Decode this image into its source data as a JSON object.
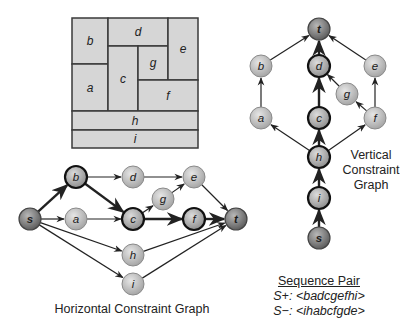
{
  "floorplan": {
    "blocks": [
      {
        "id": "b",
        "label": "b",
        "x": 72,
        "y": 18,
        "w": 36,
        "h": 46
      },
      {
        "id": "a",
        "label": "a",
        "x": 72,
        "y": 64,
        "w": 36,
        "h": 47
      },
      {
        "id": "d",
        "label": "d",
        "x": 108,
        "y": 18,
        "w": 60,
        "h": 28
      },
      {
        "id": "c",
        "label": "c",
        "x": 108,
        "y": 46,
        "w": 30,
        "h": 65
      },
      {
        "id": "g",
        "label": "g",
        "x": 138,
        "y": 46,
        "w": 30,
        "h": 34
      },
      {
        "id": "e",
        "label": "e",
        "x": 168,
        "y": 18,
        "w": 30,
        "h": 62
      },
      {
        "id": "f",
        "label": "f",
        "x": 138,
        "y": 80,
        "w": 60,
        "h": 31
      },
      {
        "id": "h",
        "label": "h",
        "x": 72,
        "y": 111,
        "w": 126,
        "h": 19
      },
      {
        "id": "i",
        "label": "i",
        "x": 72,
        "y": 130,
        "w": 126,
        "h": 18
      }
    ],
    "fill": "#d6d6d6",
    "stroke": "#3a3a3a"
  },
  "horizontal_graph": {
    "title": "Horizontal Constraint Graph",
    "nodes": [
      {
        "id": "s",
        "label": "s",
        "x": 30,
        "y": 219,
        "kind": "terminal"
      },
      {
        "id": "b",
        "label": "b",
        "x": 76,
        "y": 177,
        "kind": "critical"
      },
      {
        "id": "a",
        "label": "a",
        "x": 76,
        "y": 219,
        "kind": "normal"
      },
      {
        "id": "d",
        "label": "d",
        "x": 133,
        "y": 177,
        "kind": "normal"
      },
      {
        "id": "c",
        "label": "c",
        "x": 133,
        "y": 219,
        "kind": "critical"
      },
      {
        "id": "g",
        "label": "g",
        "x": 163,
        "y": 199,
        "kind": "normal"
      },
      {
        "id": "e",
        "label": "e",
        "x": 194,
        "y": 177,
        "kind": "normal"
      },
      {
        "id": "f",
        "label": "f",
        "x": 194,
        "y": 219,
        "kind": "critical"
      },
      {
        "id": "h",
        "label": "h",
        "x": 133,
        "y": 255,
        "kind": "normal"
      },
      {
        "id": "i",
        "label": "i",
        "x": 133,
        "y": 284,
        "kind": "normal"
      },
      {
        "id": "t",
        "label": "t",
        "x": 236,
        "y": 219,
        "kind": "terminal"
      }
    ],
    "edges": [
      {
        "from": "s",
        "to": "b",
        "critical": true
      },
      {
        "from": "s",
        "to": "a",
        "critical": false
      },
      {
        "from": "s",
        "to": "h",
        "critical": false
      },
      {
        "from": "s",
        "to": "i",
        "critical": false
      },
      {
        "from": "b",
        "to": "d",
        "critical": false
      },
      {
        "from": "b",
        "to": "c",
        "critical": true
      },
      {
        "from": "a",
        "to": "c",
        "critical": false
      },
      {
        "from": "d",
        "to": "e",
        "critical": false
      },
      {
        "from": "c",
        "to": "g",
        "critical": false
      },
      {
        "from": "g",
        "to": "e",
        "critical": false
      },
      {
        "from": "c",
        "to": "f",
        "critical": true
      },
      {
        "from": "e",
        "to": "t",
        "critical": false
      },
      {
        "from": "f",
        "to": "t",
        "critical": true
      },
      {
        "from": "h",
        "to": "t",
        "critical": false
      },
      {
        "from": "i",
        "to": "t",
        "critical": false
      }
    ]
  },
  "vertical_graph": {
    "title_lines": [
      "Vertical",
      "Constraint",
      "Graph"
    ],
    "nodes": [
      {
        "id": "t",
        "label": "t",
        "x": 319,
        "y": 29,
        "kind": "terminal"
      },
      {
        "id": "b",
        "label": "b",
        "x": 261,
        "y": 66,
        "kind": "normal"
      },
      {
        "id": "d",
        "label": "d",
        "x": 319,
        "y": 66,
        "kind": "critical"
      },
      {
        "id": "e",
        "label": "e",
        "x": 375,
        "y": 66,
        "kind": "normal"
      },
      {
        "id": "g",
        "label": "g",
        "x": 347,
        "y": 94,
        "kind": "normal"
      },
      {
        "id": "a",
        "label": "a",
        "x": 261,
        "y": 118,
        "kind": "normal"
      },
      {
        "id": "c",
        "label": "c",
        "x": 319,
        "y": 118,
        "kind": "critical"
      },
      {
        "id": "f",
        "label": "f",
        "x": 375,
        "y": 118,
        "kind": "normal"
      },
      {
        "id": "h",
        "label": "h",
        "x": 319,
        "y": 157,
        "kind": "critical"
      },
      {
        "id": "i",
        "label": "i",
        "x": 319,
        "y": 198,
        "kind": "critical"
      },
      {
        "id": "s",
        "label": "s",
        "x": 319,
        "y": 238,
        "kind": "terminal"
      }
    ],
    "edges": [
      {
        "from": "s",
        "to": "i",
        "critical": true
      },
      {
        "from": "i",
        "to": "h",
        "critical": true
      },
      {
        "from": "h",
        "to": "a",
        "critical": false
      },
      {
        "from": "h",
        "to": "c",
        "critical": true
      },
      {
        "from": "h",
        "to": "f",
        "critical": false
      },
      {
        "from": "a",
        "to": "b",
        "critical": false
      },
      {
        "from": "c",
        "to": "d",
        "critical": true
      },
      {
        "from": "f",
        "to": "g",
        "critical": false
      },
      {
        "from": "g",
        "to": "d",
        "critical": false
      },
      {
        "from": "f",
        "to": "e",
        "critical": false
      },
      {
        "from": "b",
        "to": "t",
        "critical": false
      },
      {
        "from": "d",
        "to": "t",
        "critical": true
      },
      {
        "from": "e",
        "to": "t",
        "critical": false
      }
    ]
  },
  "sequence_pair": {
    "title": "Sequence Pair",
    "s_plus_label": "S+:",
    "s_plus_value": "<badcgefhi>",
    "s_minus_label": "S−:",
    "s_minus_value": "<ihabcfgde>"
  },
  "colors": {
    "node_normal": "#bdbdbd",
    "node_critical": "#a9a9a9",
    "node_terminal": "#8a8a8a",
    "edge": "#222222"
  }
}
